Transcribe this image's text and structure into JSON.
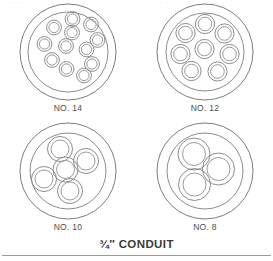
{
  "figure": {
    "caption": "¾″ CONDUIT",
    "top_artifact_left": "··      ··",
    "top_artifact_right": "·  ·  ·",
    "stroke_color": "#8c8c8c",
    "background_color": "#ffffff",
    "label_color": "#4d4d4d"
  },
  "conduits": [
    {
      "id": "no-14",
      "label": "NO. 14",
      "wire_gauge": "14",
      "wire_count": 12,
      "outer_radius": 48,
      "inner_radius": 40,
      "wire_outer_radius": 7.4,
      "wire_inner_radius": 5.1,
      "wires": [
        {
          "cx": 54.5,
          "cy": 17.0
        },
        {
          "cx": 73.0,
          "cy": 22.5
        },
        {
          "cx": 36.0,
          "cy": 25.5
        },
        {
          "cx": 54.0,
          "cy": 30.5
        },
        {
          "cx": 79.5,
          "cy": 38.0
        },
        {
          "cx": 26.5,
          "cy": 42.0
        },
        {
          "cx": 48.0,
          "cy": 44.0
        },
        {
          "cx": 68.5,
          "cy": 47.5
        },
        {
          "cx": 34.0,
          "cy": 58.0
        },
        {
          "cx": 74.0,
          "cy": 62.0
        },
        {
          "cx": 48.5,
          "cy": 67.0
        },
        {
          "cx": 66.0,
          "cy": 73.5
        }
      ]
    },
    {
      "id": "no-12",
      "label": "NO. 12",
      "wire_gauge": "12",
      "wire_count": 8,
      "outer_radius": 48,
      "inner_radius": 39,
      "wire_outer_radius": 9.6,
      "wire_inner_radius": 6.8,
      "wires": [
        {
          "cx": 50.0,
          "cy": 22.0
        },
        {
          "cx": 30.5,
          "cy": 31.0
        },
        {
          "cx": 69.5,
          "cy": 31.5
        },
        {
          "cx": 25.5,
          "cy": 52.0
        },
        {
          "cx": 49.5,
          "cy": 47.0
        },
        {
          "cx": 74.5,
          "cy": 52.0
        },
        {
          "cx": 36.5,
          "cy": 69.0
        },
        {
          "cx": 62.5,
          "cy": 69.5
        }
      ]
    },
    {
      "id": "no-10",
      "label": "NO. 10",
      "wire_gauge": "10",
      "wire_count": 5,
      "outer_radius": 48,
      "inner_radius": 38,
      "wire_outer_radius": 12.5,
      "wire_inner_radius": 9.0,
      "wires": [
        {
          "cx": 42.0,
          "cy": 28.0
        },
        {
          "cx": 68.0,
          "cy": 40.0
        },
        {
          "cx": 47.5,
          "cy": 48.5
        },
        {
          "cx": 26.0,
          "cy": 58.0
        },
        {
          "cx": 52.0,
          "cy": 70.0
        }
      ]
    },
    {
      "id": "no-8",
      "label": "NO. 8",
      "wire_gauge": "8",
      "wire_count": 3,
      "outer_radius": 48,
      "inner_radius": 38,
      "wire_outer_radius": 16.0,
      "wire_inner_radius": 11.5,
      "wires": [
        {
          "cx": 39.0,
          "cy": 33.0
        },
        {
          "cx": 63.5,
          "cy": 48.0
        },
        {
          "cx": 39.5,
          "cy": 63.5
        }
      ]
    }
  ]
}
